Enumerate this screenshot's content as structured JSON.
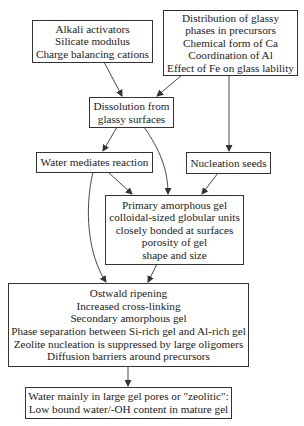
{
  "diagram": {
    "nodes": [
      {
        "id": "alkali",
        "lines": [
          "Alkali activators",
          "Silicate modulus",
          "Charge balancing cations"
        ]
      },
      {
        "id": "distribution",
        "lines": [
          "Distribution of glassy",
          "phases in precursors",
          "Chemical form of Ca",
          "Coordination of Al",
          "Effect of Fe on glass lability"
        ]
      },
      {
        "id": "dissolution",
        "lines": [
          "Dissolution from",
          "glassy surfaces"
        ]
      },
      {
        "id": "water",
        "lines": [
          "Water mediates reaction"
        ]
      },
      {
        "id": "nucleation",
        "lines": [
          "Nucleation seeds"
        ]
      },
      {
        "id": "primary_gel",
        "lines": [
          "Primary amorphous gel",
          "colloidal-sized globular units",
          "closely bonded at surfaces",
          "porosity of gel",
          "shape and size"
        ]
      },
      {
        "id": "ostwald",
        "lines": [
          "Ostwald ripening",
          "Increased cross-linking",
          "Secondary amorphous gel",
          "Phase separation between Si-rich gel and Al-rich gel",
          "Zeolite nucleation is suppressed by large oligomers",
          "Diffusion barriers around precursors"
        ]
      },
      {
        "id": "water_final",
        "lines": [
          "Water mainly in large gel pores or \"zeolitic\":",
          "Low bound water/-OH content in mature gel"
        ]
      }
    ],
    "edges": [
      {
        "from": "alkali",
        "to": "dissolution"
      },
      {
        "from": "distribution",
        "to": "dissolution"
      },
      {
        "from": "distribution",
        "to": "nucleation"
      },
      {
        "from": "dissolution",
        "to": "water"
      },
      {
        "from": "dissolution",
        "to": "primary_gel"
      },
      {
        "from": "water",
        "to": "primary_gel"
      },
      {
        "from": "water",
        "to": "ostwald"
      },
      {
        "from": "nucleation",
        "to": "primary_gel"
      },
      {
        "from": "primary_gel",
        "to": "ostwald"
      },
      {
        "from": "ostwald",
        "to": "water_final"
      }
    ],
    "colors": {
      "line": "#333333",
      "background": "#ffffff"
    }
  }
}
